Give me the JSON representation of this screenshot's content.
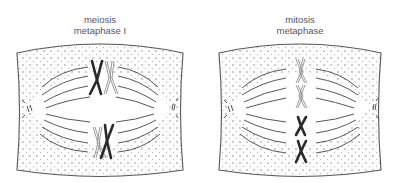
{
  "panels": [
    {
      "id": "meiosis",
      "title_line1": "meiosis",
      "title_line2": "metaphase I",
      "description": "Homologous chromosome pairs (bivalents) aligned at metaphase plate"
    },
    {
      "id": "mitosis",
      "title_line1": "mitosis",
      "title_line2": "metaphase",
      "description": "Individual chromosomes aligned singly at metaphase plate"
    }
  ],
  "colors": {
    "outline": "#555555",
    "dots": "#777777",
    "spindle": "#444444",
    "chromosome_dark": "#2a2a2a",
    "chromosome_light": "#9a9a9a",
    "label": "#55556a"
  }
}
